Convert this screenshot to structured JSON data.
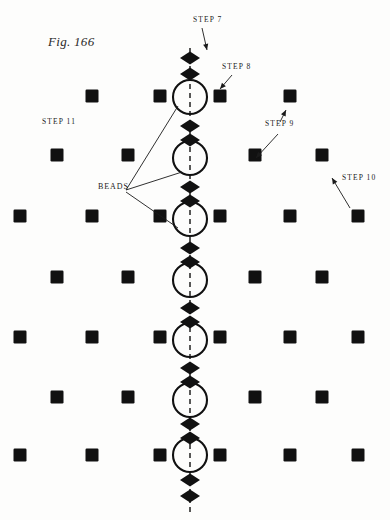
{
  "figure": {
    "caption": "Fig. 166",
    "caption_x": 48,
    "caption_y": 46
  },
  "colors": {
    "ink": "#111111",
    "page_background": "#fdfdfc",
    "label_text": "#1a1a1a"
  },
  "labels": [
    {
      "name": "step-7",
      "text": "STEP 7",
      "x": 193,
      "y": 22
    },
    {
      "name": "step-8",
      "text": "STEP 8",
      "x": 222,
      "y": 69
    },
    {
      "name": "step-9",
      "text": "STEP 9",
      "x": 265,
      "y": 126
    },
    {
      "name": "step-10",
      "text": "STEP 10",
      "x": 342,
      "y": 180
    },
    {
      "name": "step-11",
      "text": "STEP 11",
      "x": 42,
      "y": 124
    },
    {
      "name": "beads",
      "text": "BEADS",
      "x": 98,
      "y": 189
    }
  ],
  "column": {
    "center_x": 190,
    "thread_top": 48,
    "thread_bottom": 513,
    "ring_radius": 17,
    "ring_centers_y": [
      97,
      158,
      219,
      280,
      340,
      400,
      455
    ],
    "diamond_width": 20,
    "diamond_height": 13,
    "diamond_centers_y": [
      58,
      74,
      126,
      140,
      187,
      201,
      248,
      262,
      308,
      322,
      368,
      382,
      424,
      438,
      480,
      496
    ]
  },
  "square_rows": [
    {
      "y": 96,
      "xs": [
        92,
        160,
        220,
        290
      ]
    },
    {
      "y": 155,
      "xs": [
        57,
        128,
        255,
        322
      ]
    },
    {
      "y": 216,
      "xs": [
        20,
        92,
        160,
        220,
        290,
        358
      ]
    },
    {
      "y": 277,
      "xs": [
        57,
        128,
        255,
        322
      ]
    },
    {
      "y": 337,
      "xs": [
        20,
        92,
        160,
        220,
        290,
        358
      ]
    },
    {
      "y": 397,
      "xs": [
        57,
        128,
        255,
        322
      ]
    },
    {
      "y": 455,
      "xs": [
        20,
        92,
        160,
        220,
        290,
        358
      ]
    }
  ],
  "square_size": 13,
  "arrows": [
    {
      "name": "arrow-step-7",
      "x1": 202,
      "y1": 28,
      "x2": 207,
      "y2": 50
    },
    {
      "name": "arrow-step-8",
      "x1": 232,
      "y1": 75,
      "x2": 220,
      "y2": 89
    },
    {
      "name": "arrow-step-9a",
      "x1": 280,
      "y1": 122,
      "x2": 286,
      "y2": 110
    },
    {
      "name": "arrow-step-9b",
      "x1": 278,
      "y1": 134,
      "x2": 256,
      "y2": 158
    },
    {
      "name": "arrow-step-10",
      "x1": 350,
      "y1": 208,
      "x2": 332,
      "y2": 178
    }
  ],
  "beads_leaders": [
    {
      "name": "beads-leader-ring-1",
      "x1": 126,
      "y1": 190,
      "x2": 178,
      "y2": 106
    },
    {
      "name": "beads-leader-ring-2",
      "x1": 126,
      "y1": 190,
      "x2": 182,
      "y2": 172
    },
    {
      "name": "beads-leader-ring-3",
      "x1": 126,
      "y1": 192,
      "x2": 178,
      "y2": 228
    }
  ]
}
